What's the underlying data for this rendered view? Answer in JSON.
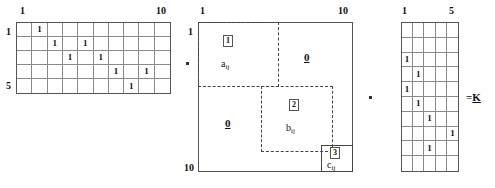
{
  "figure": {
    "type": "matrix-product-diagram",
    "equation": "A . M . B = K"
  },
  "left_matrix": {
    "name": "incidence-matrix-left",
    "rows": 5,
    "cols": 10,
    "top_left_label": "1",
    "top_right_label": "10",
    "row_first_label": "1",
    "row_last_label": "5",
    "entry_value": "1",
    "entries": [
      {
        "row": 1,
        "col": 2
      },
      {
        "row": 2,
        "col": 3
      },
      {
        "row": 2,
        "col": 5
      },
      {
        "row": 3,
        "col": 4
      },
      {
        "row": 3,
        "col": 6
      },
      {
        "row": 4,
        "col": 7
      },
      {
        "row": 4,
        "col": 9
      },
      {
        "row": 5,
        "col": 8
      }
    ]
  },
  "middle_matrix": {
    "name": "block-structured-matrix",
    "rows": 10,
    "cols": 10,
    "top_left_label": "1",
    "top_right_label": "10",
    "row_first_label": "1",
    "row_last_label": "10",
    "blocks": [
      {
        "id": "1",
        "symbol": "a",
        "subscript": "ij",
        "style": "dashed"
      },
      {
        "id": "2",
        "symbol": "b",
        "subscript": "ij",
        "style": "dashed"
      },
      {
        "id": "3",
        "symbol": "c",
        "subscript": "ij",
        "style": "solid"
      }
    ],
    "zero_blocks": [
      {
        "label": "0",
        "position": "top-right"
      },
      {
        "label": "0",
        "position": "bottom-left"
      }
    ]
  },
  "right_matrix": {
    "name": "incidence-matrix-right",
    "rows": 10,
    "cols": 5,
    "top_left_label": "1",
    "top_right_label": "5",
    "entry_value": "1",
    "entries": [
      {
        "row": 3,
        "col": 1
      },
      {
        "row": 4,
        "col": 2
      },
      {
        "row": 5,
        "col": 1
      },
      {
        "row": 6,
        "col": 2
      },
      {
        "row": 7,
        "col": 3
      },
      {
        "row": 8,
        "col": 5
      },
      {
        "row": 9,
        "col": 3
      }
    ]
  },
  "operators": {
    "mult_1": "·",
    "mult_2": "·",
    "result_prefix": "=",
    "result_symbol": "K"
  }
}
